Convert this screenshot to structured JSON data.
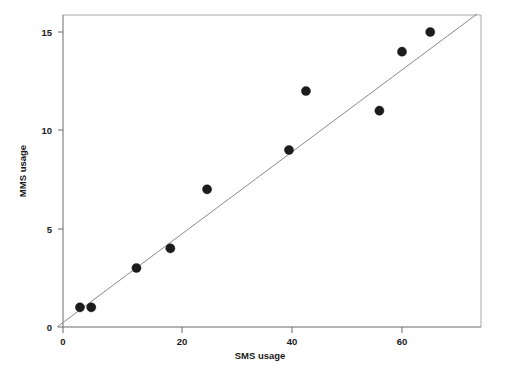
{
  "chart_data": {
    "type": "scatter",
    "title": "",
    "subtitle": "",
    "xlabel": "SMS usage",
    "ylabel": "MMS usage",
    "xlim": [
      -2,
      73
    ],
    "ylim": [
      -0.3,
      15.9
    ],
    "xticks": [
      0,
      20,
      40,
      60
    ],
    "xtick_labels": [
      "0",
      "20",
      "40",
      "60"
    ],
    "yticks": [
      0,
      5,
      10,
      15
    ],
    "ytick_labels": [
      "0",
      "5",
      "10",
      "15"
    ],
    "grid": false,
    "legend": null,
    "legend_position": "none",
    "annotations": [],
    "series": [
      {
        "name": "observations",
        "marker": "filled-circle",
        "color": "#1c1c1c",
        "x": [
          3,
          5,
          13,
          19,
          25.5,
          40,
          43,
          56,
          60,
          65
        ],
        "y": [
          1,
          1,
          3,
          4,
          7,
          9,
          12,
          11,
          14,
          15
        ],
        "points": [
          {
            "x": 3,
            "y": 1
          },
          {
            "x": 5,
            "y": 1
          },
          {
            "x": 13,
            "y": 3
          },
          {
            "x": 19,
            "y": 4
          },
          {
            "x": 25.5,
            "y": 7
          },
          {
            "x": 40,
            "y": 9
          },
          {
            "x": 43,
            "y": 12
          },
          {
            "x": 56,
            "y": 11
          },
          {
            "x": 60,
            "y": 14
          },
          {
            "x": 65,
            "y": 15
          }
        ]
      }
    ],
    "fit_line": {
      "name": "linear-fit",
      "color": "#8a8a8a",
      "x_start": -1.1,
      "y_start": 0,
      "x_end": 70.5,
      "y_end": 15.85
    }
  },
  "axes": {
    "y_axis_label": "MMS usage",
    "x_axis_label": "SMS usage",
    "y_tick_0": "0",
    "y_tick_5": "5",
    "y_tick_10": "10",
    "y_tick_15": "15",
    "x_tick_0": "0",
    "x_tick_20": "20",
    "x_tick_40": "40",
    "x_tick_60": "60"
  },
  "colors": {
    "point": "#1c1c1c",
    "fit_line": "#8a8a8a",
    "frame": "#a8a8a8",
    "axis": "#6b6b6b",
    "text": "#1a1a1a",
    "background": "#ffffff"
  }
}
